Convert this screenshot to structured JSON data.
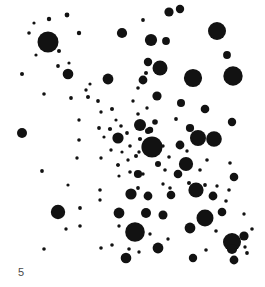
{
  "figure": {
    "label": "5",
    "background_color": "#ffffff",
    "marker_color": "#121212"
  },
  "chart_data": {
    "type": "scatter",
    "title": "",
    "subtitle": "",
    "xlabel": "",
    "ylabel": "",
    "annotations": [
      {
        "text": "5",
        "x": 18,
        "y": 272
      }
    ],
    "grid": false,
    "legend": null,
    "axes_visible": false,
    "tick_labels": {
      "x": [],
      "y": []
    },
    "xlim": [
      0,
      265
    ],
    "ylim": [
      0,
      287
    ],
    "marker_shape": "circle",
    "marker_color": "#121212",
    "point_count": 139,
    "size_encoding": "radius in pixels; markers grow from upper-left sparse region toward lower-right dense region",
    "points": [
      {
        "x": 48,
        "y": 42,
        "r": 10.5
      },
      {
        "x": 34,
        "y": 23,
        "r": 1.6
      },
      {
        "x": 49,
        "y": 19,
        "r": 2.2
      },
      {
        "x": 67,
        "y": 15,
        "r": 2.4
      },
      {
        "x": 29,
        "y": 33,
        "r": 1.8
      },
      {
        "x": 36,
        "y": 55,
        "r": 1.6
      },
      {
        "x": 59,
        "y": 51,
        "r": 2.0
      },
      {
        "x": 79,
        "y": 33,
        "r": 2.2
      },
      {
        "x": 58,
        "y": 66,
        "r": 1.9
      },
      {
        "x": 69,
        "y": 63,
        "r": 1.6
      },
      {
        "x": 22,
        "y": 74,
        "r": 2.0
      },
      {
        "x": 68,
        "y": 74,
        "r": 5.3
      },
      {
        "x": 44,
        "y": 94,
        "r": 1.8
      },
      {
        "x": 71,
        "y": 98,
        "r": 1.9
      },
      {
        "x": 86,
        "y": 90,
        "r": 1.7
      },
      {
        "x": 88,
        "y": 97,
        "r": 2.0
      },
      {
        "x": 108,
        "y": 79,
        "r": 5.4
      },
      {
        "x": 90,
        "y": 84,
        "r": 1.6
      },
      {
        "x": 98,
        "y": 101,
        "r": 1.9
      },
      {
        "x": 79,
        "y": 120,
        "r": 1.7
      },
      {
        "x": 101,
        "y": 112,
        "r": 1.7
      },
      {
        "x": 112,
        "y": 109,
        "r": 2.0
      },
      {
        "x": 116,
        "y": 120,
        "r": 1.6
      },
      {
        "x": 79,
        "y": 140,
        "r": 1.8
      },
      {
        "x": 99,
        "y": 128,
        "r": 1.9
      },
      {
        "x": 110,
        "y": 129,
        "r": 2.1
      },
      {
        "x": 121,
        "y": 126,
        "r": 1.8
      },
      {
        "x": 104,
        "y": 137,
        "r": 1.6
      },
      {
        "x": 119,
        "y": 141,
        "r": 1.7
      },
      {
        "x": 127,
        "y": 133,
        "r": 1.9
      },
      {
        "x": 22,
        "y": 133,
        "r": 5.0
      },
      {
        "x": 111,
        "y": 150,
        "r": 1.7
      },
      {
        "x": 122,
        "y": 152,
        "r": 1.6
      },
      {
        "x": 130,
        "y": 146,
        "r": 1.8
      },
      {
        "x": 140,
        "y": 139,
        "r": 2.1
      },
      {
        "x": 101,
        "y": 158,
        "r": 1.7
      },
      {
        "x": 118,
        "y": 165,
        "r": 1.8
      },
      {
        "x": 128,
        "y": 160,
        "r": 1.7
      },
      {
        "x": 136,
        "y": 156,
        "r": 2.0
      },
      {
        "x": 119,
        "y": 176,
        "r": 1.6
      },
      {
        "x": 130,
        "y": 172,
        "r": 1.8
      },
      {
        "x": 42,
        "y": 171,
        "r": 1.9
      },
      {
        "x": 77,
        "y": 158,
        "r": 1.7
      },
      {
        "x": 68,
        "y": 185,
        "r": 1.6
      },
      {
        "x": 100,
        "y": 190,
        "r": 1.8
      },
      {
        "x": 58,
        "y": 212,
        "r": 7.2
      },
      {
        "x": 80,
        "y": 208,
        "r": 1.9
      },
      {
        "x": 66,
        "y": 229,
        "r": 1.7
      },
      {
        "x": 80,
        "y": 226,
        "r": 1.8
      },
      {
        "x": 44,
        "y": 249,
        "r": 1.8
      },
      {
        "x": 100,
        "y": 200,
        "r": 1.7
      },
      {
        "x": 101,
        "y": 248,
        "r": 1.8
      },
      {
        "x": 119,
        "y": 226,
        "r": 1.7
      },
      {
        "x": 138,
        "y": 188,
        "r": 1.9
      },
      {
        "x": 143,
        "y": 174,
        "r": 1.7
      },
      {
        "x": 118,
        "y": 138,
        "r": 5.6
      },
      {
        "x": 118,
        "y": 165,
        "r": 1.8
      },
      {
        "x": 140,
        "y": 125,
        "r": 6.0
      },
      {
        "x": 148,
        "y": 131,
        "r": 3.0
      },
      {
        "x": 152,
        "y": 147,
        "r": 10.6
      },
      {
        "x": 131,
        "y": 194,
        "r": 5.6
      },
      {
        "x": 138,
        "y": 174,
        "r": 4.1
      },
      {
        "x": 119,
        "y": 213,
        "r": 5.4
      },
      {
        "x": 146,
        "y": 213,
        "r": 5.0
      },
      {
        "x": 135,
        "y": 232,
        "r": 9.8
      },
      {
        "x": 126,
        "y": 258,
        "r": 5.3
      },
      {
        "x": 158,
        "y": 248,
        "r": 5.4
      },
      {
        "x": 139,
        "y": 252,
        "r": 1.7
      },
      {
        "x": 129,
        "y": 249,
        "r": 1.8
      },
      {
        "x": 122,
        "y": 33,
        "r": 5.1
      },
      {
        "x": 143,
        "y": 20,
        "r": 1.9
      },
      {
        "x": 169,
        "y": 12,
        "r": 4.6
      },
      {
        "x": 180,
        "y": 9,
        "r": 4.2
      },
      {
        "x": 151,
        "y": 40,
        "r": 6.1
      },
      {
        "x": 146,
        "y": 73,
        "r": 2.0
      },
      {
        "x": 138,
        "y": 88,
        "r": 1.8
      },
      {
        "x": 133,
        "y": 101,
        "r": 1.7
      },
      {
        "x": 160,
        "y": 68,
        "r": 7.5
      },
      {
        "x": 148,
        "y": 62,
        "r": 4.2
      },
      {
        "x": 143,
        "y": 80,
        "r": 4.4
      },
      {
        "x": 157,
        "y": 96,
        "r": 4.6
      },
      {
        "x": 166,
        "y": 41,
        "r": 3.9
      },
      {
        "x": 181,
        "y": 103,
        "r": 4.0
      },
      {
        "x": 205,
        "y": 109,
        "r": 4.3
      },
      {
        "x": 193,
        "y": 78,
        "r": 9.1
      },
      {
        "x": 233,
        "y": 76,
        "r": 9.7
      },
      {
        "x": 217,
        "y": 31,
        "r": 9.0
      },
      {
        "x": 227,
        "y": 55,
        "r": 3.9
      },
      {
        "x": 190,
        "y": 128,
        "r": 4.1
      },
      {
        "x": 198,
        "y": 138,
        "r": 8.0
      },
      {
        "x": 214,
        "y": 139,
        "r": 7.8
      },
      {
        "x": 180,
        "y": 145,
        "r": 4.4
      },
      {
        "x": 150,
        "y": 130,
        "r": 3.2
      },
      {
        "x": 155,
        "y": 122,
        "r": 2.8
      },
      {
        "x": 186,
        "y": 164,
        "r": 7.1
      },
      {
        "x": 178,
        "y": 174,
        "r": 4.3
      },
      {
        "x": 165,
        "y": 170,
        "r": 1.8
      },
      {
        "x": 163,
        "y": 184,
        "r": 1.7
      },
      {
        "x": 158,
        "y": 164,
        "r": 3.0
      },
      {
        "x": 139,
        "y": 152,
        "r": 1.7
      },
      {
        "x": 170,
        "y": 188,
        "r": 1.8
      },
      {
        "x": 196,
        "y": 190,
        "r": 7.6
      },
      {
        "x": 189,
        "y": 183,
        "r": 2.0
      },
      {
        "x": 205,
        "y": 185,
        "r": 1.9
      },
      {
        "x": 171,
        "y": 195,
        "r": 4.3
      },
      {
        "x": 213,
        "y": 196,
        "r": 4.4
      },
      {
        "x": 234,
        "y": 177,
        "r": 4.3
      },
      {
        "x": 232,
        "y": 122,
        "r": 4.2
      },
      {
        "x": 207,
        "y": 160,
        "r": 1.8
      },
      {
        "x": 163,
        "y": 215,
        "r": 4.5
      },
      {
        "x": 148,
        "y": 196,
        "r": 4.4
      },
      {
        "x": 205,
        "y": 218,
        "r": 8.5
      },
      {
        "x": 222,
        "y": 212,
        "r": 4.3
      },
      {
        "x": 190,
        "y": 228,
        "r": 5.4
      },
      {
        "x": 216,
        "y": 231,
        "r": 1.8
      },
      {
        "x": 232,
        "y": 242,
        "r": 9.0
      },
      {
        "x": 244,
        "y": 236,
        "r": 4.6
      },
      {
        "x": 232,
        "y": 249,
        "r": 5.1
      },
      {
        "x": 247,
        "y": 253,
        "r": 1.9
      },
      {
        "x": 245,
        "y": 247,
        "r": 1.7
      },
      {
        "x": 234,
        "y": 260,
        "r": 4.4
      },
      {
        "x": 206,
        "y": 250,
        "r": 1.8
      },
      {
        "x": 193,
        "y": 258,
        "r": 4.2
      },
      {
        "x": 158,
        "y": 248,
        "r": 4.6
      },
      {
        "x": 217,
        "y": 186,
        "r": 1.7
      },
      {
        "x": 229,
        "y": 190,
        "r": 1.8
      },
      {
        "x": 226,
        "y": 201,
        "r": 1.8
      },
      {
        "x": 163,
        "y": 146,
        "r": 1.7
      },
      {
        "x": 169,
        "y": 157,
        "r": 1.8
      },
      {
        "x": 176,
        "y": 119,
        "r": 1.9
      },
      {
        "x": 147,
        "y": 108,
        "r": 1.7
      },
      {
        "x": 138,
        "y": 114,
        "r": 1.8
      },
      {
        "x": 187,
        "y": 151,
        "r": 1.7
      },
      {
        "x": 200,
        "y": 170,
        "r": 1.8
      },
      {
        "x": 244,
        "y": 214,
        "r": 1.7
      },
      {
        "x": 252,
        "y": 229,
        "r": 1.8
      },
      {
        "x": 230,
        "y": 163,
        "r": 1.8
      },
      {
        "x": 168,
        "y": 239,
        "r": 1.7
      },
      {
        "x": 112,
        "y": 245,
        "r": 1.8
      },
      {
        "x": 150,
        "y": 234,
        "r": 1.7
      }
    ]
  }
}
